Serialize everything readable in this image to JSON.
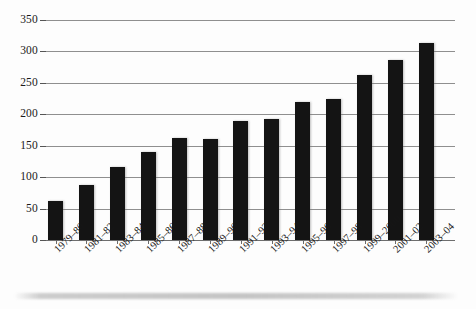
{
  "chart_data": {
    "type": "bar",
    "title": "",
    "subtitle": "",
    "xlabel": "",
    "ylabel": "",
    "ylim": [
      0,
      350
    ],
    "ytick_step": 50,
    "grid": true,
    "legend": false,
    "legend_position": "none",
    "bar_color": "#141414",
    "gridline_color": "#8f8f8f",
    "categories": [
      "1979–80",
      "1981–82",
      "1983–84",
      "1985–86",
      "1987–88",
      "1989–90",
      "1991–92",
      "1993–94",
      "1995–96",
      "1997–98",
      "1999–2000",
      "2001–02",
      "2003–04"
    ],
    "values": [
      62,
      88,
      116,
      140,
      163,
      161,
      190,
      192,
      220,
      224,
      262,
      286,
      313
    ],
    "yticks": [
      "0",
      "50",
      "100",
      "150",
      "200",
      "250",
      "300",
      "350"
    ],
    "ytick_values": [
      0,
      50,
      100,
      150,
      200,
      250,
      300,
      350
    ]
  },
  "axes": {
    "y_axis_name": "y-axis",
    "x_axis_name": "x-axis"
  }
}
